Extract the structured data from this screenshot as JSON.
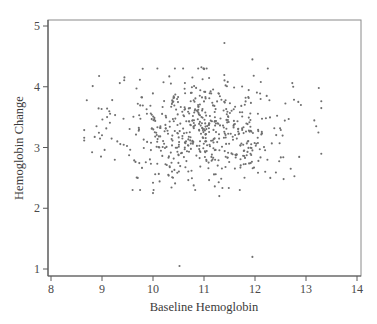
{
  "chart_data": {
    "type": "scatter",
    "title": "",
    "xlabel": "Baseline Hemoglobin",
    "ylabel": "Hemoglobin Change",
    "xlim": [
      8,
      14
    ],
    "ylim": [
      1,
      5
    ],
    "x_ticks": [
      8,
      9,
      10,
      11,
      12,
      13,
      14
    ],
    "y_ticks": [
      1,
      2,
      3,
      4,
      5
    ],
    "grid": false,
    "legend": null,
    "marker_color": "#6f6f6f",
    "approx_n_points": 600,
    "cloud_summary": {
      "x_center": 11.0,
      "x_sd": 0.85,
      "x_range": [
        8.65,
        13.3
      ],
      "y_center": 3.3,
      "y_sd": 0.45,
      "y_range": [
        2.2,
        4.7
      ]
    },
    "generator": {
      "seed": 20240611,
      "n": 580
    },
    "notable_points": [
      {
        "x": 11.4,
        "y": 4.72
      },
      {
        "x": 11.95,
        "y": 4.45
      },
      {
        "x": 12.25,
        "y": 4.3
      },
      {
        "x": 10.95,
        "y": 4.32
      },
      {
        "x": 11.05,
        "y": 4.3
      },
      {
        "x": 13.25,
        "y": 3.98
      },
      {
        "x": 13.2,
        "y": 3.35
      },
      {
        "x": 12.85,
        "y": 3.75
      },
      {
        "x": 12.9,
        "y": 3.7
      },
      {
        "x": 8.65,
        "y": 3.16
      },
      {
        "x": 8.98,
        "y": 2.85
      },
      {
        "x": 9.0,
        "y": 3.2
      },
      {
        "x": 9.05,
        "y": 2.96
      },
      {
        "x": 9.1,
        "y": 3.5
      },
      {
        "x": 9.1,
        "y": 3.64
      },
      {
        "x": 9.25,
        "y": 2.8
      },
      {
        "x": 9.3,
        "y": 3.1
      },
      {
        "x": 9.35,
        "y": 4.06
      },
      {
        "x": 9.2,
        "y": 3.78
      },
      {
        "x": 9.7,
        "y": 2.5
      },
      {
        "x": 9.6,
        "y": 2.3
      },
      {
        "x": 10.0,
        "y": 2.42
      },
      {
        "x": 10.3,
        "y": 2.55
      },
      {
        "x": 10.0,
        "y": 2.25
      },
      {
        "x": 11.3,
        "y": 2.2
      },
      {
        "x": 12.2,
        "y": 2.6
      },
      {
        "x": 12.3,
        "y": 2.5
      },
      {
        "x": 12.7,
        "y": 2.65
      },
      {
        "x": 10.52,
        "y": 1.05
      },
      {
        "x": 11.95,
        "y": 1.2
      }
    ]
  }
}
